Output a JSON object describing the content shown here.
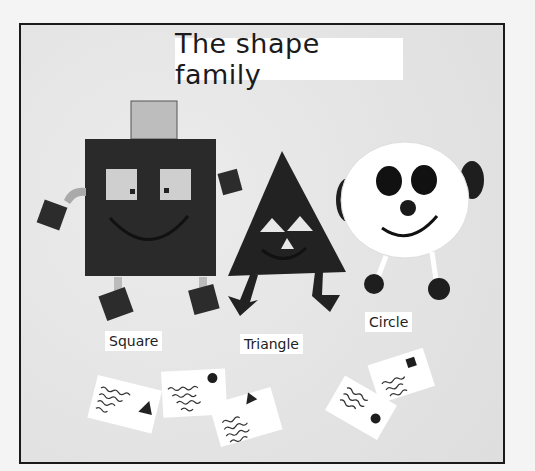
{
  "board": {
    "title": "The shape family",
    "background_color": "#e6e6e6",
    "frame_color": "#1a1a1a"
  },
  "characters": [
    {
      "name": "Square",
      "label": "Square",
      "body_color": "#2a2a2a",
      "features": [
        "square-eyes",
        "smile",
        "square-hat",
        "square-hands",
        "square-feet"
      ]
    },
    {
      "name": "Triangle",
      "label": "Triangle",
      "body_color": "#222222",
      "features": [
        "triangle-eyes",
        "triangle-nose",
        "smile",
        "arrow-feet"
      ]
    },
    {
      "name": "Circle",
      "label": "Circle",
      "body_color": "#ffffff",
      "features": [
        "round-eyes",
        "round-nose",
        "smile",
        "round-ears",
        "round-feet"
      ]
    }
  ],
  "letters": [
    {
      "stamp": "triangle",
      "lines": 4
    },
    {
      "stamp": "circle",
      "lines": 4
    },
    {
      "stamp": "triangle",
      "lines": 4
    },
    {
      "stamp": "circle",
      "lines": 3
    },
    {
      "stamp": "square",
      "lines": 3
    }
  ]
}
